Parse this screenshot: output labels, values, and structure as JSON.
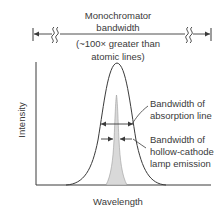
{
  "title": {
    "line1": "Monochromator",
    "line2": "bandwidth",
    "note_line1": "(~100× greater than",
    "note_line2": "atomic lines)"
  },
  "axes": {
    "ylabel": "Intensity",
    "xlabel": "Wavelength"
  },
  "annotations": {
    "absorption": {
      "line1": "Bandwidth of",
      "line2": "absorption line"
    },
    "emission": {
      "line1": "Bandwidth of",
      "line2": "hollow-cathode",
      "line3": "lamp emission"
    }
  },
  "colors": {
    "line": "#3a3a3a",
    "emission_fill": "#d9d9d9",
    "emission_stroke": "#9a9a9a"
  }
}
